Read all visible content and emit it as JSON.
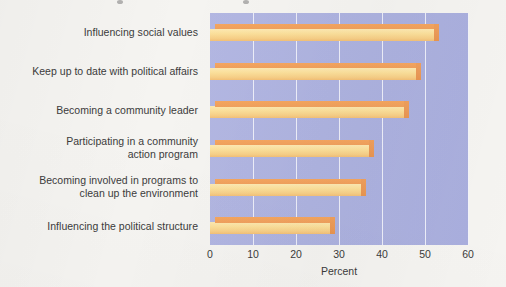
{
  "chart_data": {
    "type": "bar",
    "orientation": "horizontal",
    "title": "",
    "xlabel": "Percent",
    "ylabel": "",
    "xlim": [
      0,
      60
    ],
    "xticks": [
      0,
      10,
      20,
      30,
      40,
      50,
      60
    ],
    "grid": true,
    "legend": "none",
    "categories": [
      "Influencing the political structure",
      "Becoming involved in programs to\nclean up the environment",
      "Participating in a community\naction program",
      "Becoming a community leader",
      "Keep up to date with political affairs",
      "Influencing social values"
    ],
    "values": [
      28,
      35,
      37,
      45,
      48,
      52
    ],
    "colors": {
      "bar_top": "#f0a05d",
      "bar_front": "#fbdf9a",
      "bar_side": "#e8944f",
      "plot_background": "#aeb3e0",
      "gridline": "#f2f3fb",
      "text": "#3b3b3b",
      "page_background": "#f5f4f1"
    }
  }
}
